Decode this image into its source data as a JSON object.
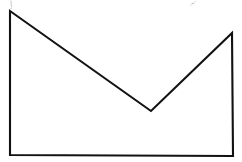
{
  "figure": {
    "title": "Envelope polygon line drawing",
    "background_color": "#ffffff",
    "stroke_color": "#121212",
    "stroke_width": 2.1,
    "canvas": {
      "width": 242,
      "height": 162,
      "units": "pixels"
    },
    "shape": {
      "name": "envelope-polygon",
      "closed": true,
      "vertex_count": 5,
      "vertices": [
        {
          "label": "top-left-apex",
          "x": 10,
          "y": 11
        },
        {
          "label": "center-valley-vertex",
          "x": 151,
          "y": 111
        },
        {
          "label": "top-right-apex",
          "x": 232,
          "y": 33
        },
        {
          "label": "bottom-right-corner",
          "x": 233,
          "y": 156
        },
        {
          "label": "bottom-left-corner",
          "x": 10,
          "y": 155
        }
      ],
      "path": "M 10 11 L 151 111 L 232 33 L 233 156 L 10 155 Z",
      "edges": [
        {
          "name": "upper-left-diagonal",
          "from": "top-left-apex",
          "to": "center-valley-vertex"
        },
        {
          "name": "upper-right-diagonal",
          "from": "center-valley-vertex",
          "to": "top-right-apex"
        },
        {
          "name": "right-vertical-edge",
          "from": "top-right-apex",
          "to": "bottom-right-corner"
        },
        {
          "name": "bottom-horizontal-edge",
          "from": "bottom-right-corner",
          "to": "bottom-left-corner"
        },
        {
          "name": "left-vertical-edge",
          "from": "bottom-left-corner",
          "to": "top-left-apex"
        }
      ]
    },
    "artifacts": [
      {
        "name": "scan-speck-top-left",
        "path": "M 11 1 L 11.5 7",
        "color": "#b9b9b9"
      },
      {
        "name": "scan-speck-top-left-dot",
        "path": "M 10.5 8.5 L 11.5 8.5",
        "color": "#d6d6d6"
      },
      {
        "name": "scan-speck-top-right",
        "path": "M 190 6 L 196 1",
        "color": "#d6d6d6"
      },
      {
        "name": "scan-speck-top-right-dot",
        "path": "M 192 3.5 L 193.5 3.5",
        "color": "#b9b9b9"
      }
    ]
  }
}
